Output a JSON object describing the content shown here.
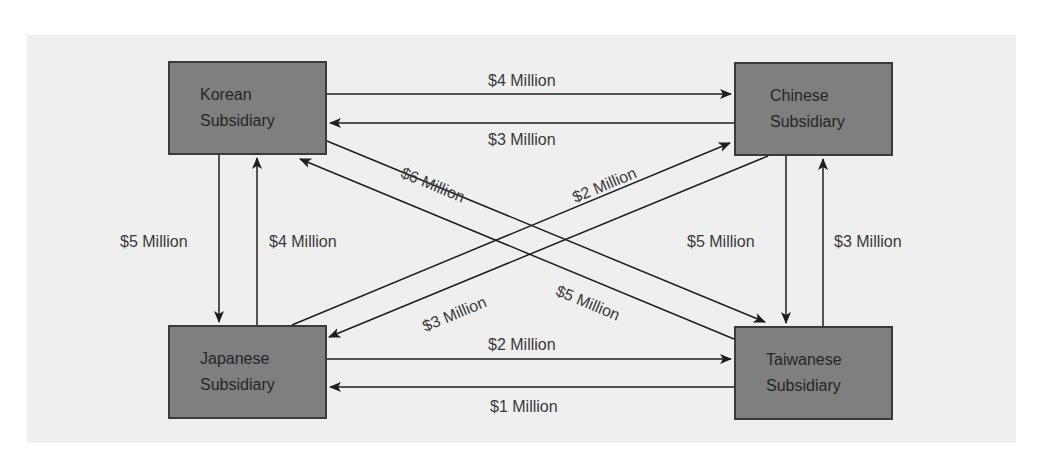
{
  "diagram": {
    "type": "flow",
    "colors": {
      "panel_background": "#efefef",
      "node_fill": "#7f7f7f",
      "node_border": "#3a3a3a",
      "line": "#1e1e1e",
      "label_text": "#3a3a3a"
    },
    "nodes": [
      {
        "id": "korean",
        "line1": "Korean",
        "line2": "Subsidiary"
      },
      {
        "id": "chinese",
        "line1": "Chinese",
        "line2": "Subsidiary"
      },
      {
        "id": "japanese",
        "line1": "Japanese",
        "line2": "Subsidiary"
      },
      {
        "id": "taiwanese",
        "line1": "Taiwanese",
        "line2": "Subsidiary"
      }
    ],
    "flows": [
      {
        "from": "korean",
        "to": "chinese",
        "label": "$4 Million",
        "amount_millions": 4
      },
      {
        "from": "chinese",
        "to": "korean",
        "label": "$3 Million",
        "amount_millions": 3
      },
      {
        "from": "korean",
        "to": "japanese",
        "label": "$5 Million",
        "amount_millions": 5
      },
      {
        "from": "japanese",
        "to": "korean",
        "label": "$4 Million",
        "amount_millions": 4
      },
      {
        "from": "chinese",
        "to": "taiwanese",
        "label": "$5 Million",
        "amount_millions": 5
      },
      {
        "from": "taiwanese",
        "to": "chinese",
        "label": "$3 Million",
        "amount_millions": 3
      },
      {
        "from": "japanese",
        "to": "taiwanese",
        "label": "$2 Million",
        "amount_millions": 2
      },
      {
        "from": "taiwanese",
        "to": "japanese",
        "label": "$1 Million",
        "amount_millions": 1
      },
      {
        "from": "korean",
        "to": "taiwanese",
        "label": "$6 Million",
        "amount_millions": 6
      },
      {
        "from": "taiwanese",
        "to": "korean",
        "label": "$5 Million",
        "amount_millions": 5
      },
      {
        "from": "japanese",
        "to": "chinese",
        "label": "$2 Million",
        "amount_millions": 2
      },
      {
        "from": "chinese",
        "to": "japanese",
        "label": "$3 Million",
        "amount_millions": 3
      }
    ]
  }
}
